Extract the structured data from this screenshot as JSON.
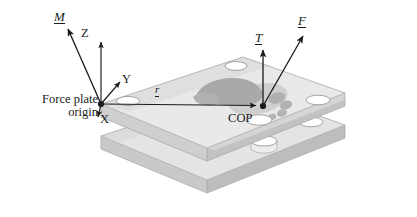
{
  "figure": {
    "labels": {
      "origin": "Force plate origin",
      "origin_line1": "Force plate",
      "origin_line2": "origin",
      "cop": "COP",
      "axis_x": "X",
      "axis_y": "Y",
      "axis_z": "Z",
      "moment": "M",
      "torque": "T",
      "force": "F",
      "position_vector": "r"
    },
    "colors": {
      "ink": "#1a1a1a",
      "plate_top": "#e6e6e6",
      "plate_top_shade": "#d2d2d2",
      "plate_edge": "#c4c4c4",
      "plate_edge_dark": "#b5b5b5",
      "plate_bottom": "#dedede",
      "hole_fill": "#ffffff",
      "hole_stroke": "#9a9a9a",
      "foot_dark": "#a8a8a8",
      "foot_light": "#cdcdcd",
      "background": "#ffffff"
    },
    "elements": {
      "plates": [
        {
          "name": "upper-plate",
          "holes": 4
        },
        {
          "name": "lower-plate",
          "holes": 4
        }
      ],
      "foot_outline": "footprint with heel, arch, forefoot pad and five toe dots",
      "markers": [
        {
          "name": "origin-marker",
          "x": 101,
          "y": 104
        },
        {
          "name": "cop-marker",
          "x": 263,
          "y": 106
        }
      ],
      "vectors": [
        {
          "name": "moment-vector",
          "label": "M",
          "from": [
            101,
            104
          ],
          "to": [
            67,
            26
          ]
        },
        {
          "name": "z-axis-vector",
          "label": "Z",
          "from": [
            101,
            104
          ],
          "to": [
            101,
            40
          ]
        },
        {
          "name": "y-axis-vector",
          "label": "Y",
          "from": [
            101,
            104
          ],
          "to": [
            122,
            80
          ]
        },
        {
          "name": "x-axis-vector",
          "label": "X",
          "from": [
            101,
            104
          ],
          "to": [
            100,
            118
          ]
        },
        {
          "name": "r-vector",
          "label": "r",
          "from": [
            101,
            104
          ],
          "to": [
            259,
            106
          ]
        },
        {
          "name": "torque-vector",
          "label": "T",
          "from": [
            263,
            106
          ],
          "to": [
            263,
            47
          ]
        },
        {
          "name": "force-vector",
          "label": "F",
          "from": [
            263,
            106
          ],
          "to": [
            305,
            33
          ]
        }
      ]
    }
  }
}
